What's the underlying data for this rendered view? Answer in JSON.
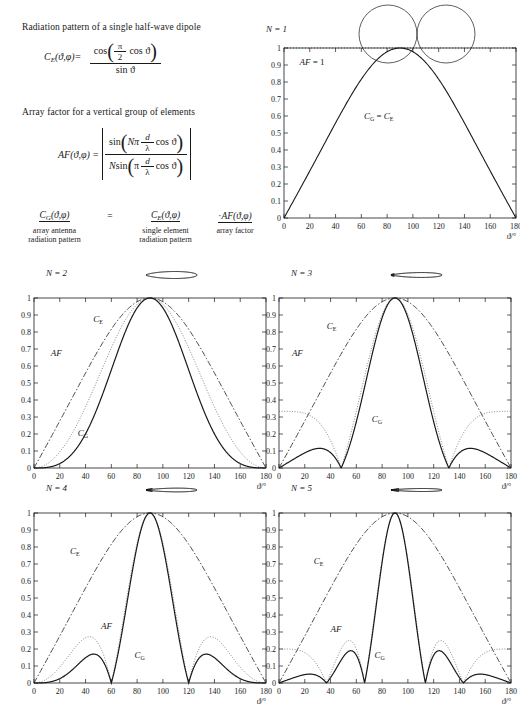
{
  "header": {
    "title_ce": "Radiation pattern of a single half-wave dipole",
    "title_af": "Array factor for a vertical group of elements",
    "ce_lhs": "C",
    "ce_lhs_sub": "E",
    "ce_args": "(ϑ,φ)=",
    "ce_num": "cos",
    "ce_num_inner_frac_num": "π",
    "ce_num_inner_frac_den": "2",
    "ce_num_tail": "cos ϑ",
    "ce_den": "sin ϑ",
    "af_lhs": "AF",
    "af_args": "(ϑ,φ) =",
    "af_num_fn": "sin",
    "af_num_N": "Nπ",
    "af_num_frac_num": "d",
    "af_num_frac_den": "λ",
    "af_num_tail": "cos ϑ",
    "af_den_N": "N",
    "af_den_fn": "sin",
    "af_den_pi": "π",
    "af_den_frac_num": "d",
    "af_den_frac_den": "λ",
    "af_den_tail": "cos ϑ"
  },
  "product": {
    "cg": "C",
    "cg_sub": "G",
    "cg_args": "(ϑ,φ)",
    "equals": "=",
    "ce": "C",
    "ce_sub": "E",
    "ce_args": "(ϑ,φ)",
    "dot": "·",
    "af": "AF",
    "af_args": "(ϑ,φ)",
    "label_cg_1": "array antenna",
    "label_cg_2": "radiation pattern",
    "label_ce_1": "single element",
    "label_ce_2": "radiation pattern",
    "label_af": "array factor"
  },
  "axis": {
    "xlabel": "ϑ/°",
    "xticks": [
      0,
      20,
      40,
      60,
      80,
      100,
      120,
      140,
      160,
      180
    ],
    "yticks": [
      "0",
      "0.1",
      "0.2",
      "0.3",
      "0.4",
      "0.5",
      "0.6",
      "0.7",
      "0.8",
      "0.9",
      "1"
    ],
    "xlim": [
      0,
      180
    ],
    "ylim": [
      0,
      1
    ]
  },
  "panels": [
    {
      "id": "N1",
      "n_label": "N = 1",
      "annotations": [
        {
          "key": "af1",
          "text": "AF = 1",
          "x": 12,
          "y": 0.9
        },
        {
          "key": "cgce",
          "text": "Cᴳ = Cᴱ",
          "x": 62,
          "y": 0.58
        }
      ],
      "labels": {
        "af": "AF = 1",
        "cg_ce": "CG = CE"
      },
      "polar": "two-circles"
    },
    {
      "id": "N2",
      "n_label": "N = 2",
      "annotations": [
        {
          "key": "af",
          "text": "AF",
          "x": 13,
          "y": 0.66
        },
        {
          "key": "ce",
          "text": "CE",
          "x": 46,
          "y": 0.86
        },
        {
          "key": "cg",
          "text": "CG",
          "x": 34,
          "y": 0.19
        }
      ]
    },
    {
      "id": "N3",
      "n_label": "N = 3",
      "annotations": [
        {
          "key": "af",
          "text": "AF",
          "x": 10,
          "y": 0.66
        },
        {
          "key": "ce",
          "text": "CE",
          "x": 37,
          "y": 0.82
        },
        {
          "key": "cg",
          "text": "CG",
          "x": 72,
          "y": 0.27
        }
      ]
    },
    {
      "id": "N4",
      "n_label": "N = 4",
      "annotations": [
        {
          "key": "ce",
          "text": "CE",
          "x": 28,
          "y": 0.76
        },
        {
          "key": "af",
          "text": "AF",
          "x": 52,
          "y": 0.32
        },
        {
          "key": "cg",
          "text": "CG",
          "x": 78,
          "y": 0.15
        }
      ]
    },
    {
      "id": "N5",
      "n_label": "N = 5",
      "annotations": [
        {
          "key": "ce",
          "text": "CE",
          "x": 27,
          "y": 0.7
        },
        {
          "key": "af",
          "text": "AF",
          "x": 40,
          "y": 0.3
        },
        {
          "key": "cg",
          "text": "CG",
          "x": 74,
          "y": 0.15
        }
      ]
    }
  ],
  "chart_data": {
    "type": "line",
    "xlabel": "ϑ/°",
    "ylabel": "",
    "xlim": [
      0,
      180
    ],
    "ylim": [
      0,
      1
    ],
    "grid": false,
    "x_tick_labels": [
      0,
      20,
      40,
      60,
      80,
      100,
      120,
      140,
      160,
      180
    ],
    "y_tick_labels": [
      0,
      0.1,
      0.2,
      0.3,
      0.4,
      0.5,
      0.6,
      0.7,
      0.8,
      0.9,
      1
    ],
    "element_spacing_d_over_lambda": 0.5,
    "series_definitions": [
      {
        "name": "CE",
        "style": "dash-dot",
        "formula": "cos(pi/2*cos(theta))/sin(theta)"
      },
      {
        "name": "AF",
        "style": "dotted",
        "formula": "|sin(N*pi*d/lambda*cos(theta))/(N*sin(pi*d/lambda*cos(theta)))|"
      },
      {
        "name": "CG",
        "style": "solid",
        "formula": "CE * AF"
      }
    ],
    "subplots": [
      {
        "N": 1,
        "n_label": "N = 1",
        "notes": "AF = 1, so CG = CE",
        "series": [
          {
            "name": "CG = CE",
            "style": "solid",
            "x": [
              0,
              10,
              20,
              30,
              40,
              50,
              60,
              70,
              80,
              90,
              100,
              110,
              120,
              130,
              140,
              150,
              160,
              170,
              180
            ],
            "y": [
              0,
              0.14,
              0.29,
              0.43,
              0.57,
              0.7,
              0.81,
              0.91,
              0.98,
              1,
              0.98,
              0.91,
              0.81,
              0.7,
              0.57,
              0.43,
              0.29,
              0.14,
              0
            ]
          }
        ],
        "cg_peaks": [
          {
            "theta": 90,
            "value": 1
          }
        ],
        "cg_nulls": [
          0,
          180
        ]
      },
      {
        "N": 2,
        "n_label": "N = 2",
        "af_at_zero": 0.85,
        "cg_main_peak": {
          "theta": 90,
          "value": 1
        },
        "cg_sidelobe_peaks": [
          {
            "theta": 30,
            "value": 0.26
          },
          {
            "theta": 148,
            "value": 0.26
          }
        ],
        "cg_nulls": [
          0,
          52,
          127,
          180
        ],
        "af_nulls": [
          60,
          120
        ]
      },
      {
        "N": 3,
        "n_label": "N = 3",
        "af_at_zero": 0.62,
        "cg_main_peak": {
          "theta": 90,
          "value": 1
        },
        "cg_sidelobe_peaks": [
          {
            "theta": 20,
            "value": 0.12
          },
          {
            "theta": 53,
            "value": 0.25
          },
          {
            "theta": 126,
            "value": 0.25
          },
          {
            "theta": 160,
            "value": 0.12
          }
        ],
        "af_sidelobe_peaks": [
          {
            "theta": 53,
            "value": 0.33
          },
          {
            "theta": 126,
            "value": 0.33
          }
        ],
        "cg_nulls": [
          0,
          36,
          66,
          114,
          143,
          180
        ],
        "af_nulls": [
          48,
          70,
          110,
          131
        ]
      },
      {
        "N": 4,
        "n_label": "N = 4",
        "af_at_zero": 0.37,
        "cg_main_peak": {
          "theta": 90,
          "value": 1
        },
        "cg_sidelobe_peaks": [
          {
            "theta": 10,
            "value": 0.04
          },
          {
            "theta": 38,
            "value": 0.155
          },
          {
            "theta": 63,
            "value": 0.24
          },
          {
            "theta": 116,
            "value": 0.24
          },
          {
            "theta": 141,
            "value": 0.155
          },
          {
            "theta": 170,
            "value": 0.04
          }
        ],
        "af_sidelobe_peaks": [
          {
            "theta": 38,
            "value": 0.28
          },
          {
            "theta": 63,
            "value": 0.27
          },
          {
            "theta": 116,
            "value": 0.27
          },
          {
            "theta": 141,
            "value": 0.28
          }
        ],
        "cg_nulls": [
          0,
          24,
          52,
          73,
          106,
          127,
          155,
          180
        ],
        "af_nulls": [
          0,
          24,
          52,
          73,
          106,
          127,
          155,
          180
        ]
      },
      {
        "N": 5,
        "n_label": "N = 5",
        "af_at_zero": 0.1,
        "af_sidelobe_peaks": [
          {
            "theta": 30,
            "value": 0.25
          },
          {
            "theta": 55,
            "value": 0.2
          },
          {
            "theta": 72,
            "value": 0.24
          },
          {
            "theta": 108,
            "value": 0.24
          },
          {
            "theta": 125,
            "value": 0.2
          },
          {
            "theta": 150,
            "value": 0.25
          }
        ],
        "cg_main_peak": {
          "theta": 90,
          "value": 1
        },
        "cg_sidelobe_peaks": [
          {
            "theta": 30,
            "value": 0.12
          },
          {
            "theta": 55,
            "value": 0.15
          },
          {
            "theta": 72,
            "value": 0.235
          },
          {
            "theta": 108,
            "value": 0.235
          },
          {
            "theta": 125,
            "value": 0.15
          },
          {
            "theta": 150,
            "value": 0.12
          }
        ],
        "cg_nulls": [
          0,
          15,
          43,
          62,
          78,
          102,
          118,
          137,
          165,
          180
        ]
      }
    ],
    "polar_insets": [
      {
        "N": 1,
        "description": "two tangent circles (figure-eight broadside)",
        "petals": 2
      },
      {
        "N": 2,
        "description": "two large horizontal lobes plus small central rosette",
        "petals": 6
      },
      {
        "N": 3,
        "description": "narrower horizontal lobes with larger central rosette",
        "petals": 10
      },
      {
        "N": 4,
        "description": "narrow horizontal lobes, dense central rosette",
        "petals": 14
      },
      {
        "N": 5,
        "description": "narrowest horizontal lobes, densest central rosette",
        "petals": 18
      }
    ]
  }
}
